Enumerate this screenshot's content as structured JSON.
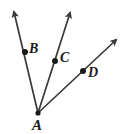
{
  "figure": {
    "name": "angle-rays-diagram",
    "background_color": "#ffffff",
    "stroke_color": "#3a3a3a",
    "label_color": "#1a1a1a",
    "width": 123,
    "height": 134,
    "vertex": {
      "label": "A",
      "x": 38,
      "y": 113,
      "label_x": 32,
      "label_y": 118,
      "font_size": 15
    },
    "rays": [
      {
        "id": "ray-ab",
        "point_label": "B",
        "from_x": 38,
        "from_y": 113,
        "to_x": 14,
        "to_y": 12,
        "dot_x": 25,
        "dot_y": 52,
        "dot_r": 3,
        "label_x": 29,
        "label_y": 42,
        "font_size": 14
      },
      {
        "id": "ray-ac",
        "point_label": "C",
        "from_x": 38,
        "from_y": 113,
        "to_x": 70,
        "to_y": 13,
        "dot_x": 55,
        "dot_y": 61,
        "dot_r": 3,
        "label_x": 60,
        "label_y": 51,
        "font_size": 14
      },
      {
        "id": "ray-ad",
        "point_label": "D",
        "from_x": 38,
        "from_y": 113,
        "to_x": 116,
        "to_y": 40,
        "dot_x": 83,
        "dot_y": 71,
        "dot_r": 3,
        "label_x": 88,
        "label_y": 66,
        "font_size": 14
      }
    ]
  }
}
